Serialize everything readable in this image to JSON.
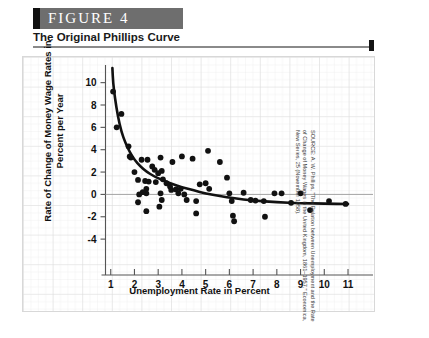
{
  "figure": {
    "label": "FIGURE  4",
    "subtitle": "The Original Phillips Curve",
    "source": "SOURCE: A. W. Phillips, \"The Relation between Unemployment and the Rate of Change of Money Wages in the United Kingdom, 1861–1957,\" Economica, New Series, 25 (November 1958)."
  },
  "colors": {
    "header_bg": "#6e6e6e",
    "header_accent": "#111111",
    "rule": "#8a8a8a",
    "grid": "#e2e2e2",
    "axis": "#555555",
    "point": "#111111",
    "curve": "#111111"
  },
  "chart_data": {
    "type": "scatter",
    "title": "The Original Phillips Curve",
    "xlabel": "Unemployment Rate in Percent",
    "ylabel": "Rate of Change of Money Wage Rates in Percent per Year",
    "xlim": [
      0,
      11.8
    ],
    "ylim": [
      -5.6,
      11.4
    ],
    "xticks": [
      1,
      2,
      3,
      4,
      5,
      6,
      7,
      8,
      9,
      10,
      11
    ],
    "yticks": [
      10,
      8,
      6,
      4,
      2,
      0,
      -2,
      -4
    ],
    "grid": true,
    "zero_line": true,
    "legend": "none",
    "points": [
      [
        1.1,
        9.2
      ],
      [
        1.45,
        7.2
      ],
      [
        1.25,
        6.0
      ],
      [
        1.75,
        4.3
      ],
      [
        1.8,
        3.4
      ],
      [
        1.85,
        3.3
      ],
      [
        2.0,
        2.0
      ],
      [
        2.3,
        3.1
      ],
      [
        2.55,
        3.1
      ],
      [
        3.1,
        3.3
      ],
      [
        2.15,
        1.3
      ],
      [
        2.45,
        1.2
      ],
      [
        2.6,
        1.15
      ],
      [
        2.9,
        1.1
      ],
      [
        2.5,
        0.5
      ],
      [
        2.5,
        0.1
      ],
      [
        2.35,
        0.2
      ],
      [
        2.2,
        0.0
      ],
      [
        2.15,
        -0.7
      ],
      [
        2.5,
        -1.5
      ],
      [
        2.75,
        2.5
      ],
      [
        2.85,
        2.2
      ],
      [
        3.0,
        1.9
      ],
      [
        3.15,
        2.1
      ],
      [
        3.2,
        1.35
      ],
      [
        3.35,
        1.0
      ],
      [
        3.1,
        0.1
      ],
      [
        3.15,
        -0.5
      ],
      [
        3.05,
        -1.1
      ],
      [
        3.5,
        0.7
      ],
      [
        3.55,
        0.4
      ],
      [
        3.75,
        0.45
      ],
      [
        3.85,
        0.1
      ],
      [
        3.95,
        0.5
      ],
      [
        4.1,
        0.0
      ],
      [
        4.2,
        -0.5
      ],
      [
        3.6,
        2.9
      ],
      [
        4.0,
        3.4
      ],
      [
        4.45,
        3.2
      ],
      [
        4.75,
        0.9
      ],
      [
        4.6,
        -0.6
      ],
      [
        4.6,
        -1.7
      ],
      [
        5.0,
        1.0
      ],
      [
        5.15,
        0.5
      ],
      [
        5.1,
        3.9
      ],
      [
        5.6,
        2.9
      ],
      [
        5.9,
        1.5
      ],
      [
        6.0,
        0.1
      ],
      [
        6.1,
        -0.6
      ],
      [
        6.15,
        -1.9
      ],
      [
        6.2,
        -2.4
      ],
      [
        6.6,
        0.15
      ],
      [
        6.9,
        -0.5
      ],
      [
        7.1,
        -0.55
      ],
      [
        7.45,
        -0.6
      ],
      [
        7.5,
        -2.0
      ],
      [
        7.9,
        0.1
      ],
      [
        8.2,
        0.1
      ],
      [
        8.6,
        -0.75
      ],
      [
        9.0,
        0.1
      ],
      [
        9.4,
        -1.4
      ],
      [
        10.2,
        -0.6
      ],
      [
        10.9,
        -0.85
      ]
    ],
    "curve": {
      "description": "Fitted Phillips curve: steep decline from about 11%% at 1.1%% unemployment, flattening toward -0.8%% near 11%% unemployment",
      "points": [
        [
          1.07,
          11.3
        ],
        [
          1.1,
          10.0
        ],
        [
          1.18,
          8.6
        ],
        [
          1.3,
          7.0
        ],
        [
          1.45,
          5.6
        ],
        [
          1.62,
          4.6
        ],
        [
          1.8,
          3.8
        ],
        [
          2.0,
          3.1
        ],
        [
          2.25,
          2.5
        ],
        [
          2.5,
          2.05
        ],
        [
          2.8,
          1.65
        ],
        [
          3.1,
          1.35
        ],
        [
          3.5,
          1.0
        ],
        [
          4.0,
          0.65
        ],
        [
          4.5,
          0.35
        ],
        [
          5.0,
          0.1
        ],
        [
          5.6,
          -0.15
        ],
        [
          6.2,
          -0.35
        ],
        [
          7.0,
          -0.55
        ],
        [
          8.0,
          -0.7
        ],
        [
          9.0,
          -0.78
        ],
        [
          10.0,
          -0.83
        ],
        [
          11.0,
          -0.86
        ]
      ]
    }
  }
}
